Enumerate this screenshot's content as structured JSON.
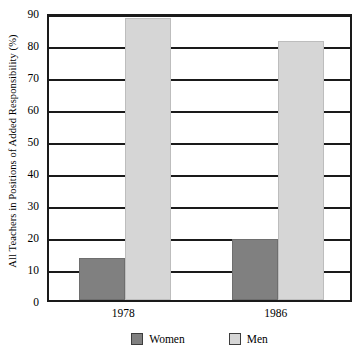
{
  "chart_data": {
    "type": "bar",
    "title": "",
    "subtitle": "",
    "xlabel": "",
    "ylabel": "All Teachers in Positions of Added Responsibility (%)",
    "categories": [
      "1978",
      "1986"
    ],
    "series": [
      {
        "name": "Women",
        "values": [
          13,
          19
        ],
        "color": "#808080"
      },
      {
        "name": "Men",
        "values": [
          88,
          81
        ],
        "color": "#d6d6d6"
      }
    ],
    "ylim": [
      0,
      90
    ],
    "ytick_values": [
      0,
      10,
      20,
      30,
      40,
      50,
      60,
      70,
      80,
      90
    ],
    "ytick_labels": [
      "0",
      "10",
      "20",
      "30",
      "40",
      "50",
      "60",
      "70",
      "80",
      "90"
    ],
    "grid": true,
    "grid_axis": "y",
    "legend_position": "bottom-center",
    "legend_entries": [
      "Women",
      "Men"
    ],
    "frame": true,
    "annotations": []
  },
  "axes": {
    "y_title": "All Teachers in Positions of Added Responsibility (%)"
  },
  "legend": {
    "items": [
      {
        "label": "Women",
        "swatch": "legend-swatch-women"
      },
      {
        "label": "Men",
        "swatch": "legend-swatch-men"
      }
    ]
  },
  "colors": {
    "women": "#808080",
    "men": "#d6d6d6",
    "frame": "#1a1a1a",
    "background": "#ffffff"
  }
}
